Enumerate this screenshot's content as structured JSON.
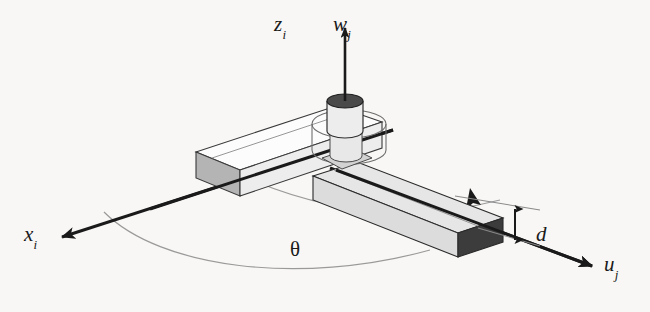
{
  "figure": {
    "background_color": "#f8f7f5",
    "line_color": "#1a1a1a",
    "thin_line_color": "#8c8c8c",
    "labels": {
      "z_axis": {
        "base": "z",
        "sub": "i",
        "name": "z-axis-label"
      },
      "w_axis": {
        "base": "w",
        "sub": "j",
        "name": "w-axis-label"
      },
      "x_axis": {
        "base": "x",
        "sub": "i",
        "name": "x-axis-label"
      },
      "u_axis": {
        "base": "u",
        "sub": "j",
        "name": "u-axis-label"
      },
      "offset": {
        "base": "d",
        "sub": "",
        "name": "d-offset-label"
      },
      "angle": {
        "symbol": "θ",
        "name": "theta-angle-label"
      }
    },
    "parts": {
      "upper_link_fill": "#fbfbfb",
      "upper_link_cap_fill": "#b4b4b4",
      "lower_link_fill": "#dcdcdc",
      "lower_link_cap_fill": "#3c3c3c",
      "cylinder_fill": "#eeeeee",
      "cylinder_top_fill": "#4a4a4a",
      "collar_fill": "#f4f4f4"
    }
  }
}
